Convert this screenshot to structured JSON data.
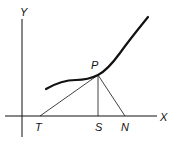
{
  "diagram": {
    "axes": {
      "x_label": "X",
      "y_label": "Y"
    },
    "points": {
      "P": "P",
      "T": "T",
      "S": "S",
      "N": "N"
    }
  }
}
